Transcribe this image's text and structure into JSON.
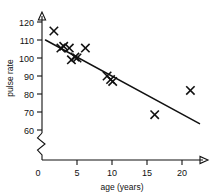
{
  "chart_data": {
    "type": "scatter",
    "title": "",
    "xlabel": "age (years)",
    "ylabel": "pulse rate",
    "xlim": [
      0,
      22.5
    ],
    "ylim": [
      60,
      122
    ],
    "grid": false,
    "legend": null,
    "x_ticks": [
      0,
      5,
      10,
      15,
      20
    ],
    "x_tick_labels": [
      "0",
      "5",
      "10",
      "15",
      "20"
    ],
    "y_ticks": [
      60,
      70,
      80,
      90,
      100,
      110,
      120
    ],
    "y_tick_labels": [
      "60",
      "70",
      "80",
      "90",
      "100",
      "110",
      "120"
    ],
    "y_axis_break": true,
    "y_axis_break_note": "zigzag break between 0 and 60",
    "points": [
      {
        "x": 1.7,
        "y": 115
      },
      {
        "x": 2.7,
        "y": 105.5
      },
      {
        "x": 3.1,
        "y": 106.5
      },
      {
        "x": 3.9,
        "y": 105.5
      },
      {
        "x": 4.2,
        "y": 99
      },
      {
        "x": 4.7,
        "y": 100.5
      },
      {
        "x": 5.0,
        "y": 100
      },
      {
        "x": 6.2,
        "y": 105.5
      },
      {
        "x": 9.3,
        "y": 90
      },
      {
        "x": 9.8,
        "y": 88
      },
      {
        "x": 10.1,
        "y": 87
      },
      {
        "x": 16.1,
        "y": 68.5
      },
      {
        "x": 21.2,
        "y": 82
      }
    ],
    "marker": "x",
    "trend_line": {
      "type": "linear-fit",
      "x_start": 0.5,
      "y_start": 110,
      "x_end": 22.5,
      "y_end": 63.5
    },
    "colors": {
      "axis": "#111111",
      "marker": "#111111",
      "trend": "#111111",
      "background": "#ffffff"
    }
  }
}
